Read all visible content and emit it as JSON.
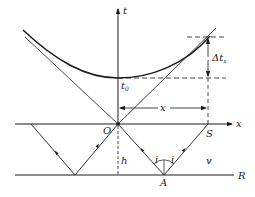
{
  "diagram": {
    "axes": {
      "vertical_label": "t",
      "horizontal_label": "x"
    },
    "labels": {
      "origin": "O",
      "t_zero": "t",
      "t_zero_sub": "0",
      "delta_t": "Δt",
      "delta_t_sub": "x",
      "offset": "x",
      "depth": "h",
      "receiver": "S",
      "reflection_point": "A",
      "reflector": "R",
      "velocity": "v",
      "incidence_angle_left": "i",
      "incidence_angle_right": "i"
    },
    "colors": {
      "line": "#1a1a1a",
      "background": "#ffffff"
    }
  }
}
